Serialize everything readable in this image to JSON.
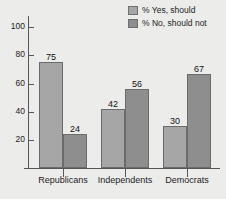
{
  "chart_data": {
    "type": "bar",
    "title": "",
    "xlabel": "",
    "ylabel": "",
    "categories": [
      "Republicans",
      "Independents",
      "Democrats"
    ],
    "series": [
      {
        "name": "% Yes, should",
        "values": [
          75,
          42,
          30
        ],
        "color": "#a6a6a6"
      },
      {
        "name": "% No, should not",
        "values": [
          24,
          56,
          67
        ],
        "color": "#8e8e8e"
      }
    ],
    "yticks": [
      20,
      40,
      60,
      80,
      100
    ],
    "ylim": [
      0,
      108
    ],
    "grid": false,
    "legend_position": "top-right",
    "data_labels": true,
    "background_color": "#ececeb",
    "axis_color": "#55565a"
  }
}
